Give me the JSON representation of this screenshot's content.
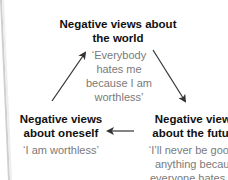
{
  "diagram": {
    "nodes": {
      "world": {
        "title_lines": [
          "Negative views about",
          "the world"
        ],
        "quote_lines": [
          "‘Everybody",
          "hates me",
          "because I am",
          "worthless’"
        ]
      },
      "self": {
        "title_lines": [
          "Negative views",
          "about oneself"
        ],
        "quote_lines": [
          "‘I am worthless’"
        ]
      },
      "future": {
        "title_lines": [
          "Negative views",
          "about the future"
        ],
        "quote_lines": [
          "‘I’ll never be good at",
          "anything because",
          "everyone hates me’"
        ]
      }
    },
    "arrows": [
      {
        "from": "self",
        "to": "world",
        "icon": "arrow-up-right-icon"
      },
      {
        "from": "world",
        "to": "future",
        "icon": "arrow-down-right-icon"
      },
      {
        "from": "future",
        "to": "self",
        "icon": "arrow-left-icon"
      }
    ],
    "colors": {
      "title": "#111111",
      "quote": "#7a7a7a",
      "arrow": "#333333",
      "page_edge": "#c8c8c8"
    }
  }
}
